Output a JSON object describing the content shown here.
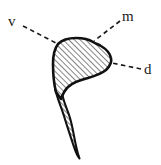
{
  "figure": {
    "type": "anatomical-line-drawing",
    "background_color": "#ffffff",
    "ink_color": "#111111",
    "fill_pattern": "diagonal-hatching",
    "labels": [
      {
        "id": "v",
        "text": "v",
        "position": "top-left"
      },
      {
        "id": "m",
        "text": "m",
        "position": "top-right"
      },
      {
        "id": "d",
        "text": "d",
        "position": "middle-right"
      }
    ],
    "leaders": [
      {
        "for": "v",
        "from_x": 23,
        "from_y": 26,
        "to_x": 58,
        "to_y": 44
      },
      {
        "for": "m",
        "from_x": 120,
        "from_y": 21,
        "to_x": 95,
        "to_y": 41
      },
      {
        "for": "d",
        "from_x": 141,
        "from_y": 69,
        "to_x": 112,
        "to_y": 63
      }
    ]
  }
}
